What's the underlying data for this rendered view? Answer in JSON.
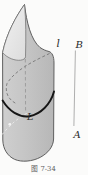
{
  "figure": {
    "caption": "图 7-34",
    "labels": {
      "generator_line": "l",
      "segment_top": "B",
      "segment_bottom": "A",
      "directrix_curve": "L"
    }
  },
  "colors": {
    "background": "#fbfbfa",
    "body_light": "#cfcfcf",
    "body_mid": "#c5c5c5",
    "body_dark": "#b7b7b7",
    "inner_light": "#f1f1f1",
    "inner_dark": "#dcdcdc",
    "outline": "#5f5f5f",
    "inner_outline": "#6a6a6a",
    "directrix_stroke": "#151515",
    "hidden_dash": "#6f6f6f",
    "axis_dash": "#8d8d8d",
    "light_dash": "#e9e9e9",
    "highlight_dot": "#f4f4f4",
    "segment_line": "#9a9a9a",
    "label_text": "#2a2a2a",
    "caption_text": "#5a5a5a"
  }
}
